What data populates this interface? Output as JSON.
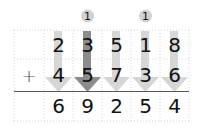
{
  "problem": {
    "operator": "+",
    "addend1": [
      "2",
      "3",
      "5",
      "1",
      "8"
    ],
    "addend2": [
      "4",
      "5",
      "7",
      "3",
      "6"
    ],
    "sum": [
      "6",
      "9",
      "2",
      "5",
      "4"
    ],
    "carries": [
      {
        "column": 1,
        "value": "1"
      },
      {
        "column": 3,
        "value": "1"
      }
    ],
    "highlighted_column": 1
  },
  "colors": {
    "light_arrow": "#d4d4d4",
    "dark_arrow": "#8a8a8a",
    "carry_circle": "#d0d0d0",
    "grid": "#d8d8d8",
    "sum_line": "#555555"
  }
}
